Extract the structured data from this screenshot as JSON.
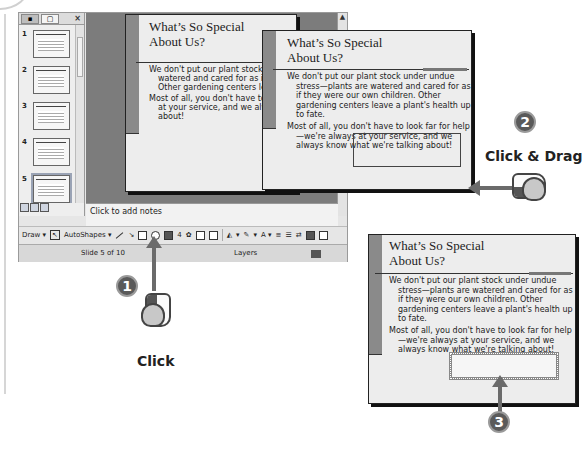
{
  "app": {
    "pane_tabs": [
      {
        "icon": "outline-tab-icon"
      },
      {
        "icon": "slides-tab-icon"
      }
    ],
    "pane_close": "×",
    "thumbnails": [
      {
        "number": "1"
      },
      {
        "number": "2"
      },
      {
        "number": "3"
      },
      {
        "number": "4"
      },
      {
        "number": "5",
        "selected": true
      },
      {
        "number": "6"
      }
    ],
    "notes_placeholder": "Click to add notes",
    "drawbar": {
      "draw_label": "Draw ▾",
      "autoshapes_label": "AutoShapes ▾",
      "fill_color_label": "▾",
      "line_color_label": "▾",
      "font_color_label": "A ▾"
    },
    "status": {
      "slide": "Slide 5 of 10",
      "design": "Layers"
    }
  },
  "slide": {
    "title_line1": "What’s So Special",
    "title_line2": "About Us?",
    "para1": "We don't put our plant stock under undue stress—plants are watered and cared for as if they were our own children. Other gardening centers leave a plant's health up to fate.",
    "para2": "Most of all, you don't have to look far for help—we're always at your service, and we always know what we're talking about!"
  },
  "callouts": {
    "step1": "1",
    "step1_label": "Click",
    "step2": "2",
    "step2_label": "Click & Drag",
    "step3": "3"
  },
  "colors": {
    "slide_bg": "#ededed",
    "slide_bar": "#8a8a8a",
    "workspace": "#7c7c7c",
    "step_circle": "#5a5a5a",
    "arrow": "#6b6b6b"
  }
}
